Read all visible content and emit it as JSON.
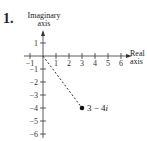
{
  "problem_number": "1.",
  "axes": {
    "y_label_line1": "Imaginary",
    "y_label_line2": "axis",
    "x_label_line1": "Real",
    "x_label_line2": "axis",
    "x_ticks": [
      "−1",
      "1",
      "2",
      "3",
      "4",
      "5",
      "6"
    ],
    "y_ticks": [
      "1",
      "−1",
      "−2",
      "−3",
      "−4",
      "−5",
      "−6"
    ]
  },
  "point": {
    "label": "3 − 4",
    "label_italic": "i",
    "real": 3,
    "imaginary": -4
  }
}
